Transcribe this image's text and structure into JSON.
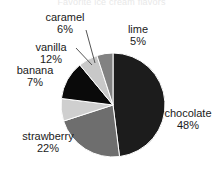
{
  "chart_data": {
    "type": "pie",
    "title": "Favorite ice cream flavors",
    "title_visible": false,
    "categories": [
      "chocolate",
      "strawberry",
      "vanilla",
      "banana",
      "caramel",
      "lime"
    ],
    "values": [
      48,
      22,
      12,
      7,
      6,
      5
    ],
    "unit": "%",
    "start_angle_deg": 0,
    "direction": "clockwise",
    "legend": "none",
    "labels_position": "outside",
    "grid": false,
    "slices": [
      {
        "name": "chocolate",
        "percent": 48,
        "label": "chocolate",
        "percent_text": "48%",
        "color": "#1c1c1c",
        "leader": false
      },
      {
        "name": "strawberry",
        "percent": 22,
        "label": "strawberry",
        "percent_text": "22%",
        "color": "#6e6e6e",
        "leader": false
      },
      {
        "name": "banana",
        "percent": 7,
        "label": "banana",
        "percent_text": "7%",
        "color": "#cfcfcf",
        "leader": false
      },
      {
        "name": "vanilla",
        "percent": 12,
        "label": "vanilla",
        "percent_text": "12%",
        "color": "#0a0a0a",
        "leader": true
      },
      {
        "name": "caramel",
        "percent": 6,
        "label": "caramel",
        "percent_text": "6%",
        "color": "#c8c8c8",
        "leader": true
      },
      {
        "name": "lime",
        "percent": 5,
        "label": "lime",
        "percent_text": "5%",
        "color": "#828282",
        "leader": false
      }
    ]
  },
  "colors": {
    "background": "#ffffff",
    "text": "#1a1a1a",
    "outline": "#ffffff",
    "leader_line": "#555555"
  },
  "geometry": {
    "center_x": 113,
    "center_y": 105,
    "radius": 52
  }
}
